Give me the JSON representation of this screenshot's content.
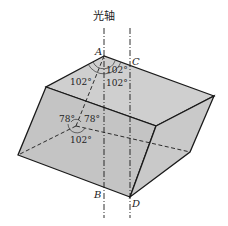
{
  "diagram": {
    "title": "光轴",
    "fill_color": "#c8c8c8",
    "edge_color": "#1a1a1a",
    "vertices": {
      "A": "A",
      "B": "B",
      "C": "C",
      "D": "D"
    },
    "angles": {
      "top_left": "102°",
      "top_right_upper": "102°",
      "top_right_lower": "102°",
      "inner_left": "78°",
      "inner_right": "78°",
      "inner_bottom": "102°"
    }
  }
}
